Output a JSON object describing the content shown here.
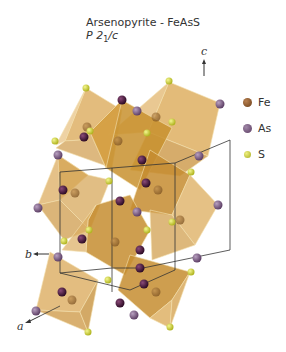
{
  "title": "Arsenopyrite - FeAsS",
  "space_group": {
    "prefix": "P 2",
    "subscript": "1",
    "suffix": "/c"
  },
  "legend": [
    {
      "label": "Fe",
      "color": "#8a5a2b"
    },
    {
      "label": "As",
      "color": "#6e4c72"
    },
    {
      "label": "S",
      "color": "#c8cc3c"
    }
  ],
  "axes": {
    "a": "a",
    "b": "b",
    "c": "c"
  },
  "colors": {
    "octahedron_fill": "#d9a552",
    "octahedron_dark": "#c48a2c",
    "fe": "#8a5a2b",
    "as_dark": "#4a1c3c",
    "as_light": "#7a5a80",
    "s": "#d2d84a"
  }
}
